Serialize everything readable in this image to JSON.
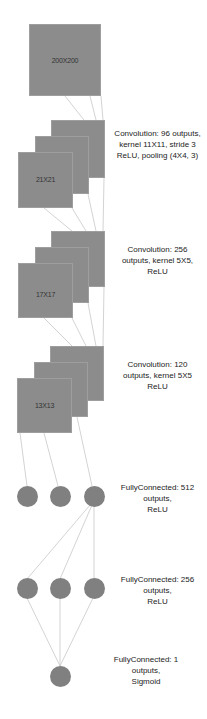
{
  "diagram": {
    "colors": {
      "box": "#8c8c8c",
      "node": "#808080",
      "wire": "#c8c8c8",
      "text": "#222222"
    },
    "input": {
      "label": "200X200"
    },
    "layers": [
      {
        "type": "conv",
        "size_label": "21X21",
        "caption": [
          "Convolution: 96 outputs,",
          "kernel 11X11, stride 3",
          "ReLU, pooling (4X4, 3)"
        ]
      },
      {
        "type": "conv",
        "size_label": "17X17",
        "caption": [
          "Convolution: 256",
          "outputs, kernel 5X5,",
          "ReLU"
        ]
      },
      {
        "type": "conv",
        "size_label": "13X13",
        "caption": [
          "Convolution: 120",
          "outputs, kernel 5X5",
          "ReLU"
        ]
      },
      {
        "type": "fc",
        "caption": [
          "FullyConnected: 512",
          "outputs,",
          "ReLU"
        ]
      },
      {
        "type": "fc",
        "caption": [
          "FullyConnected: 256",
          "outputs,",
          "ReLU"
        ]
      },
      {
        "type": "fc",
        "caption": [
          "FullyConnected: 1",
          "outputs,",
          "Sigmoid"
        ]
      }
    ]
  }
}
